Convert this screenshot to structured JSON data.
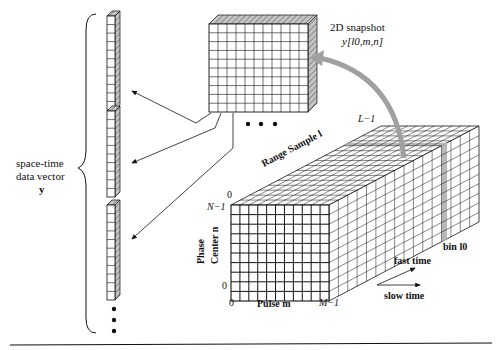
{
  "figure": {
    "left_label": {
      "line1": "space-time",
      "line2": "data vector",
      "line3": "y"
    },
    "snapshot_label": {
      "line1": "2D snapshot",
      "line2": "y[l0,m,n]"
    },
    "cube_axes": {
      "range_axis": "Range Sample l",
      "range_end": "L−1",
      "phase_axis_line1": "Phase",
      "phase_axis_line2": "Center n",
      "phase_top_zero": "0",
      "phase_top": "N−1",
      "phase_bottom": "0",
      "pulse_start": "0",
      "pulse_axis": "Pulse m",
      "pulse_end": "M−1"
    },
    "bin_label": "bin l0",
    "fast_time_label": "fast time",
    "slow_time_label": "slow time",
    "ellipsis_snapshots": "• • •",
    "colors": {
      "shade": "#b8b8b8",
      "arrow_gray": "#9a9a9a",
      "line": "#111111"
    }
  }
}
